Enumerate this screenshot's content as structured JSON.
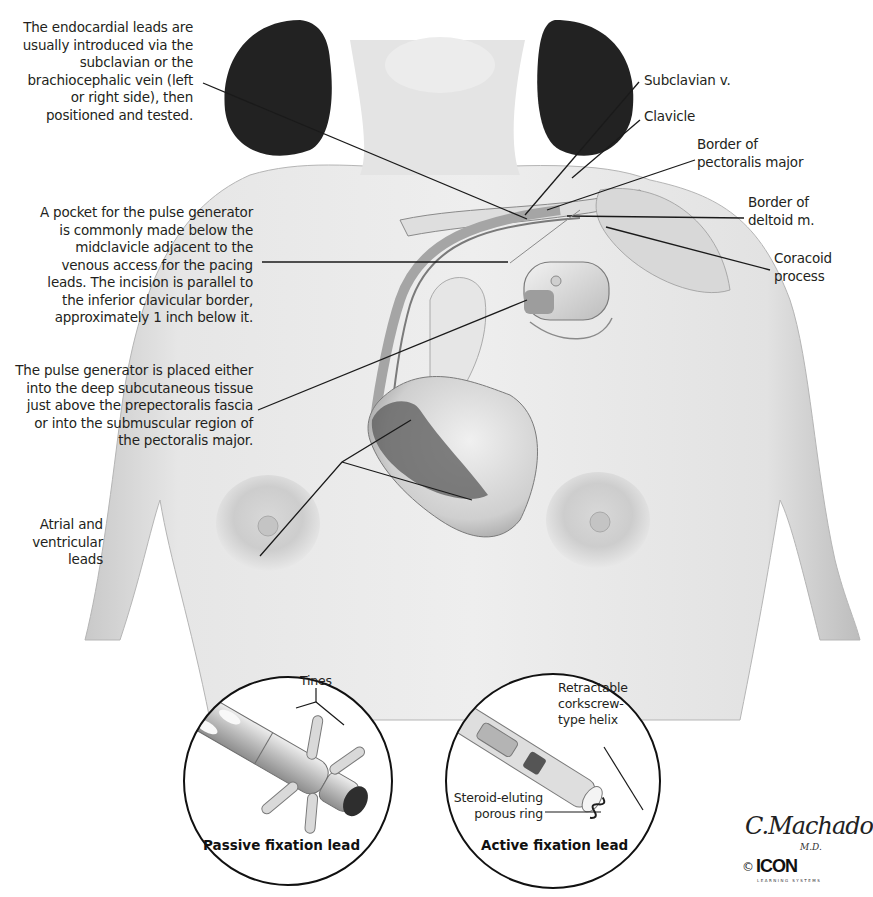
{
  "figure": {
    "title_fragment": "…y pacing",
    "left_labels": [
      {
        "id": "endocardial-leads-note",
        "lines": [
          "The endocardial leads are",
          "usually introduced via the",
          "subclavian or the",
          "brachiocephalic vein (left",
          "or right side), then",
          "positioned and tested."
        ]
      },
      {
        "id": "pocket-note",
        "lines": [
          "A pocket for the pulse generator",
          "is commonly made below the",
          "midclavicle adjacent to the",
          "venous access for the pacing",
          "leads. The incision is parallel to",
          "the inferior clavicular border,",
          "approximately 1 inch below it."
        ]
      },
      {
        "id": "generator-placement-note",
        "lines": [
          "The pulse generator is placed either",
          "into the deep subcutaneous tissue",
          "just above the prepectoralis fascia",
          "or into the submuscular region of",
          "the pectoralis major."
        ]
      },
      {
        "id": "atrial-ventricular-leads",
        "lines": [
          "Atrial and",
          "ventricular",
          "leads"
        ]
      }
    ],
    "right_labels": [
      {
        "id": "subclavian-v",
        "lines": [
          "Subclavian v."
        ]
      },
      {
        "id": "clavicle",
        "lines": [
          "Clavicle"
        ]
      },
      {
        "id": "border-pectoralis-major",
        "lines": [
          "Border of",
          "pectoralis major"
        ]
      },
      {
        "id": "border-deltoid",
        "lines": [
          "Border of",
          "deltoid m."
        ]
      },
      {
        "id": "coracoid-process",
        "lines": [
          "Coracoid",
          "process"
        ]
      }
    ],
    "insets": [
      {
        "id": "passive-fixation",
        "caption": "Passive fixation lead",
        "labels": [
          "Tines"
        ]
      },
      {
        "id": "active-fixation",
        "caption": "Active fixation lead",
        "labels": [
          "Retractable",
          "corkscrew-",
          "type helix",
          "Steroid-eluting",
          "porous ring"
        ]
      }
    ],
    "credit": {
      "signature": "C.Machado",
      "signature_suffix": "M.D.",
      "copyright_symbol": "©",
      "publisher_logo": "ICON",
      "publisher_sub": "LEARNING SYSTEMS"
    }
  },
  "colors": {
    "text": "#231f20",
    "leader": "#1a1a1a",
    "skin_light": "#ececec",
    "skin_mid": "#cfcfcf",
    "hair": "#1f1f1f"
  }
}
